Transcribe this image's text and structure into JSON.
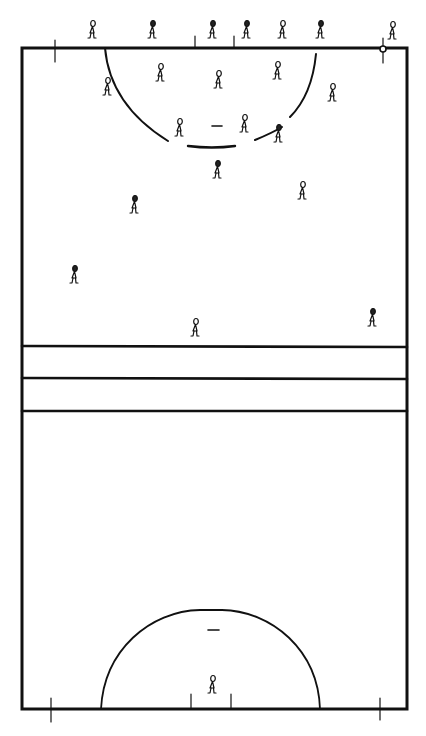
{
  "diagram": {
    "type": "court-diagram",
    "court": {
      "left": 22,
      "right": 407,
      "top": 48,
      "bottom": 709
    },
    "transverse_lines_y": [
      346,
      378,
      411
    ],
    "stroke_color": "#111111",
    "background": "#ffffff",
    "top_circle": {
      "cx": 212,
      "start_x": 105,
      "end_x": 316,
      "depth_y": 148
    },
    "bottom_circle": {
      "cx": 211,
      "start_x": 101,
      "end_x": 320,
      "top_y": 610
    },
    "players": [
      {
        "x": 92,
        "y": 35,
        "dark": false
      },
      {
        "x": 152,
        "y": 35,
        "dark": true
      },
      {
        "x": 212,
        "y": 35,
        "dark": true
      },
      {
        "x": 246,
        "y": 35,
        "dark": true
      },
      {
        "x": 282,
        "y": 35,
        "dark": false
      },
      {
        "x": 320,
        "y": 35,
        "dark": true
      },
      {
        "x": 392,
        "y": 36,
        "dark": false
      },
      {
        "x": 107,
        "y": 92,
        "dark": false
      },
      {
        "x": 160,
        "y": 78,
        "dark": false
      },
      {
        "x": 218,
        "y": 85,
        "dark": false
      },
      {
        "x": 277,
        "y": 76,
        "dark": false
      },
      {
        "x": 332,
        "y": 98,
        "dark": false
      },
      {
        "x": 179,
        "y": 133,
        "dark": false
      },
      {
        "x": 244,
        "y": 129,
        "dark": false
      },
      {
        "x": 278,
        "y": 139,
        "dark": true
      },
      {
        "x": 217,
        "y": 175,
        "dark": true
      },
      {
        "x": 302,
        "y": 196,
        "dark": false
      },
      {
        "x": 134,
        "y": 210,
        "dark": true
      },
      {
        "x": 74,
        "y": 280,
        "dark": true
      },
      {
        "x": 195,
        "y": 333,
        "dark": false
      },
      {
        "x": 372,
        "y": 323,
        "dark": true
      },
      {
        "x": 212,
        "y": 690,
        "dark": false
      }
    ]
  }
}
